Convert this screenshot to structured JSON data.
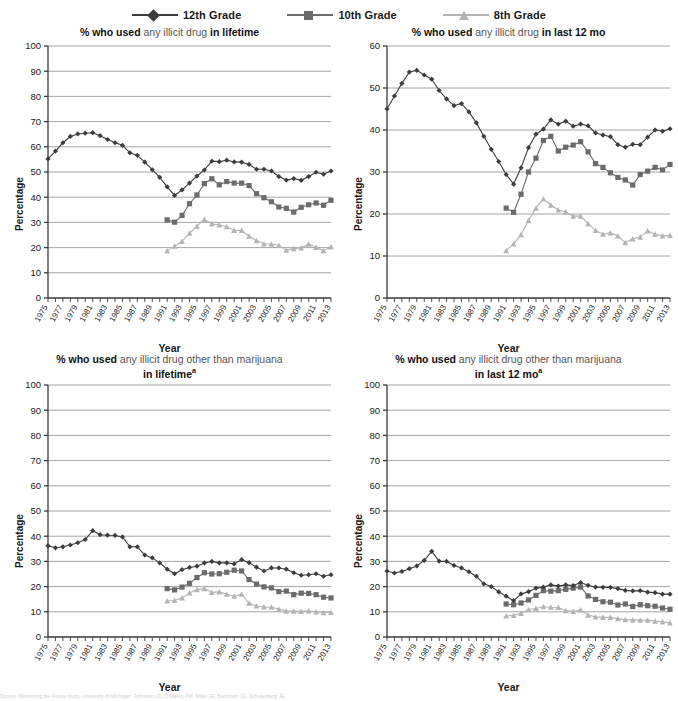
{
  "legend": {
    "items": [
      {
        "label": "12th Grade",
        "marker": "diamond",
        "color": "#3d3d3d"
      },
      {
        "label": "10th Grade",
        "marker": "square",
        "color": "#6b6b6b"
      },
      {
        "label": "8th Grade",
        "marker": "triangle",
        "color": "#b4b4b4"
      }
    ]
  },
  "axis": {
    "xlabel": "Year",
    "ylabel": "Percentage",
    "x_ticks": [
      1975,
      1977,
      1979,
      1981,
      1983,
      1985,
      1987,
      1989,
      1991,
      1993,
      1995,
      1997,
      1999,
      2001,
      2003,
      2005,
      2007,
      2009,
      2011,
      2013
    ],
    "xlim": [
      1975,
      2013
    ]
  },
  "footnote": "Source: Monitoring the Future study, University of Michigan. Johnston LD, O'Malley PM, Miller JE, Bachman JG, Schulenberg JE.",
  "chart_data": [
    {
      "id": "illicit-lifetime",
      "type": "line",
      "title_parts": [
        "% who used",
        " any illicit drug ",
        "in lifetime"
      ],
      "title_sup": "",
      "xlabel": "Year",
      "ylabel": "Percentage",
      "ylim": [
        0,
        100
      ],
      "ytick_step": 10,
      "grid": true,
      "legend_position": "top",
      "series": [
        {
          "name": "12th Grade",
          "marker": "diamond",
          "color": "#3d3d3d",
          "x": [
            1975,
            1976,
            1977,
            1978,
            1979,
            1980,
            1981,
            1982,
            1983,
            1984,
            1985,
            1986,
            1987,
            1988,
            1989,
            1990,
            1991,
            1992,
            1993,
            1994,
            1995,
            1996,
            1997,
            1998,
            1999,
            2000,
            2001,
            2002,
            2003,
            2004,
            2005,
            2006,
            2007,
            2008,
            2009,
            2010,
            2011,
            2012,
            2013
          ],
          "values": [
            55.2,
            58.3,
            61.6,
            64.1,
            65.1,
            65.4,
            65.6,
            64.4,
            62.9,
            61.6,
            60.6,
            57.6,
            56.6,
            53.9,
            50.9,
            47.9,
            44.1,
            40.7,
            42.9,
            45.6,
            48.4,
            50.8,
            54.3,
            54.1,
            54.7,
            54.0,
            53.9,
            53.0,
            51.1,
            51.1,
            50.4,
            48.2,
            46.8,
            47.4,
            46.7,
            48.2,
            49.9,
            49.1,
            50.4
          ]
        },
        {
          "name": "10th Grade",
          "marker": "square",
          "color": "#6b6b6b",
          "x": [
            1991,
            1992,
            1993,
            1994,
            1995,
            1996,
            1997,
            1998,
            1999,
            2000,
            2001,
            2002,
            2003,
            2004,
            2005,
            2006,
            2007,
            2008,
            2009,
            2010,
            2011,
            2012,
            2013
          ],
          "values": [
            31.0,
            30.1,
            32.8,
            37.4,
            40.9,
            45.4,
            47.3,
            44.9,
            46.2,
            45.6,
            45.6,
            44.6,
            41.4,
            39.8,
            38.2,
            36.1,
            35.6,
            34.1,
            36.0,
            37.0,
            37.7,
            36.8,
            38.8
          ]
        },
        {
          "name": "8th Grade",
          "marker": "triangle",
          "color": "#b4b4b4",
          "x": [
            1991,
            1992,
            1993,
            1994,
            1995,
            1996,
            1997,
            1998,
            1999,
            2000,
            2001,
            2002,
            2003,
            2004,
            2005,
            2006,
            2007,
            2008,
            2009,
            2010,
            2011,
            2012,
            2013
          ],
          "values": [
            18.7,
            20.6,
            22.5,
            25.7,
            28.5,
            31.2,
            29.4,
            29.0,
            28.3,
            26.8,
            26.8,
            24.5,
            22.8,
            21.5,
            21.4,
            20.9,
            19.0,
            19.6,
            19.9,
            21.4,
            20.1,
            18.8,
            20.3
          ]
        }
      ]
    },
    {
      "id": "illicit-12mo",
      "type": "line",
      "title_parts": [
        "% who used",
        " any illicit drug ",
        "in last 12 mo"
      ],
      "title_sup": "",
      "xlabel": "Year",
      "ylabel": "Percentage",
      "ylim": [
        0,
        60
      ],
      "ytick_step": 10,
      "grid": true,
      "legend_position": "top",
      "series": [
        {
          "name": "12th Grade",
          "marker": "diamond",
          "color": "#3d3d3d",
          "x": [
            1975,
            1976,
            1977,
            1978,
            1979,
            1980,
            1981,
            1982,
            1983,
            1984,
            1985,
            1986,
            1987,
            1988,
            1989,
            1990,
            1991,
            1992,
            1993,
            1994,
            1995,
            1996,
            1997,
            1998,
            1999,
            2000,
            2001,
            2002,
            2003,
            2004,
            2005,
            2006,
            2007,
            2008,
            2009,
            2010,
            2011,
            2012,
            2013
          ],
          "values": [
            45.0,
            48.1,
            51.1,
            53.8,
            54.2,
            53.1,
            52.1,
            49.4,
            47.4,
            45.8,
            46.3,
            44.3,
            41.7,
            38.5,
            35.4,
            32.5,
            29.4,
            27.1,
            31.0,
            35.8,
            39.0,
            40.2,
            42.4,
            41.4,
            42.1,
            40.9,
            41.4,
            41.0,
            39.3,
            38.8,
            38.4,
            36.5,
            35.9,
            36.6,
            36.5,
            38.3,
            40.0,
            39.7,
            40.3
          ]
        },
        {
          "name": "10th Grade",
          "marker": "square",
          "color": "#6b6b6b",
          "x": [
            1991,
            1992,
            1993,
            1994,
            1995,
            1996,
            1997,
            1998,
            1999,
            2000,
            2001,
            2002,
            2003,
            2004,
            2005,
            2006,
            2007,
            2008,
            2009,
            2010,
            2011,
            2012,
            2013
          ],
          "values": [
            21.4,
            20.4,
            24.7,
            30.0,
            33.3,
            37.5,
            38.5,
            35.0,
            35.9,
            36.4,
            37.2,
            34.8,
            32.0,
            31.1,
            29.8,
            28.7,
            28.1,
            26.9,
            29.4,
            30.2,
            31.1,
            30.5,
            31.8
          ]
        },
        {
          "name": "8th Grade",
          "marker": "triangle",
          "color": "#b4b4b4",
          "x": [
            1991,
            1992,
            1993,
            1994,
            1995,
            1996,
            1997,
            1998,
            1999,
            2000,
            2001,
            2002,
            2003,
            2004,
            2005,
            2006,
            2007,
            2008,
            2009,
            2010,
            2011,
            2012,
            2013
          ],
          "values": [
            11.3,
            12.9,
            15.1,
            18.5,
            21.4,
            23.6,
            22.1,
            21.0,
            20.5,
            19.5,
            19.5,
            17.7,
            16.1,
            15.2,
            15.5,
            14.8,
            13.2,
            14.1,
            14.5,
            16.0,
            15.2,
            14.8,
            14.9
          ]
        }
      ]
    },
    {
      "id": "other-than-mj-lifetime",
      "type": "line",
      "title_parts": [
        "% who used",
        " any illicit drug other than marijuana",
        ""
      ],
      "title_line2": "in lifetime",
      "title_sup": "a",
      "xlabel": "Year",
      "ylabel": "Percentage",
      "ylim": [
        0,
        100
      ],
      "ytick_step": 10,
      "grid": true,
      "legend_position": "top",
      "series": [
        {
          "name": "12th Grade",
          "marker": "diamond",
          "color": "#3d3d3d",
          "x": [
            1975,
            1976,
            1977,
            1978,
            1979,
            1980,
            1981,
            1982,
            1983,
            1984,
            1985,
            1986,
            1987,
            1988,
            1989,
            1990,
            1991,
            1992,
            1993,
            1994,
            1995,
            1996,
            1997,
            1998,
            1999,
            2000,
            2001,
            2002,
            2003,
            2004,
            2005,
            2006,
            2007,
            2008,
            2009,
            2010,
            2011,
            2012,
            2013
          ],
          "values": [
            36.2,
            35.4,
            35.8,
            36.5,
            37.4,
            38.7,
            42.2,
            40.6,
            40.4,
            40.3,
            39.7,
            35.8,
            35.8,
            32.5,
            31.4,
            29.4,
            26.9,
            25.1,
            26.7,
            27.6,
            28.1,
            29.4,
            30.0,
            29.4,
            29.4,
            29.0,
            30.7,
            29.5,
            27.7,
            26.2,
            27.4,
            27.4,
            26.9,
            25.5,
            24.5,
            24.7,
            25.1,
            24.1,
            24.7
          ]
        },
        {
          "name": "10th Grade",
          "marker": "square",
          "color": "#6b6b6b",
          "x": [
            1991,
            1992,
            1993,
            1994,
            1995,
            1996,
            1997,
            1998,
            1999,
            2000,
            2001,
            2002,
            2003,
            2004,
            2005,
            2006,
            2007,
            2008,
            2009,
            2010,
            2011,
            2012,
            2013
          ],
          "values": [
            19.2,
            18.7,
            19.8,
            21.3,
            23.6,
            25.5,
            25.0,
            25.1,
            25.7,
            26.5,
            26.2,
            22.8,
            21.0,
            19.9,
            19.5,
            18.0,
            18.2,
            16.8,
            17.4,
            17.3,
            16.8,
            15.8,
            15.5
          ]
        },
        {
          "name": "8th Grade",
          "marker": "triangle",
          "color": "#b4b4b4",
          "x": [
            1991,
            1992,
            1993,
            1994,
            1995,
            1996,
            1997,
            1998,
            1999,
            2000,
            2001,
            2002,
            2003,
            2004,
            2005,
            2006,
            2007,
            2008,
            2009,
            2010,
            2011,
            2012,
            2013
          ],
          "values": [
            14.3,
            14.5,
            15.5,
            17.5,
            18.8,
            19.2,
            17.7,
            17.9,
            17.0,
            16.2,
            17.0,
            13.4,
            12.3,
            11.9,
            11.8,
            11.1,
            10.3,
            10.3,
            10.2,
            10.4,
            10.0,
            9.7,
            9.8
          ]
        }
      ]
    },
    {
      "id": "other-than-mj-12mo",
      "type": "line",
      "title_parts": [
        "% who used",
        " any illicit drug other than marijuana",
        ""
      ],
      "title_line2": "in last 12 mo",
      "title_sup": "a",
      "xlabel": "Year",
      "ylabel": "Percentage",
      "ylim": [
        0,
        100
      ],
      "ytick_step": 10,
      "grid": true,
      "legend_position": "top",
      "series": [
        {
          "name": "12th Grade",
          "marker": "diamond",
          "color": "#3d3d3d",
          "x": [
            1975,
            1976,
            1977,
            1978,
            1979,
            1980,
            1981,
            1982,
            1983,
            1984,
            1985,
            1986,
            1987,
            1988,
            1989,
            1990,
            1991,
            1992,
            1993,
            1994,
            1995,
            1996,
            1997,
            1998,
            1999,
            2000,
            2001,
            2002,
            2003,
            2004,
            2005,
            2006,
            2007,
            2008,
            2009,
            2010,
            2011,
            2012,
            2013
          ],
          "values": [
            26.2,
            25.4,
            26.0,
            27.1,
            28.2,
            30.4,
            34.0,
            30.1,
            30.0,
            28.4,
            27.4,
            25.9,
            24.1,
            21.1,
            20.0,
            17.9,
            16.2,
            14.4,
            17.1,
            18.0,
            19.4,
            19.8,
            20.7,
            20.2,
            20.7,
            20.4,
            21.6,
            20.5,
            19.8,
            19.7,
            19.7,
            19.2,
            18.5,
            18.3,
            18.4,
            17.8,
            17.6,
            17.0,
            17.0
          ]
        },
        {
          "name": "10th Grade",
          "marker": "square",
          "color": "#6b6b6b",
          "x": [
            1991,
            1992,
            1993,
            1994,
            1995,
            1996,
            1997,
            1998,
            1999,
            2000,
            2001,
            2002,
            2003,
            2004,
            2005,
            2006,
            2007,
            2008,
            2009,
            2010,
            2011,
            2012,
            2013
          ],
          "values": [
            13.1,
            12.8,
            13.5,
            14.7,
            16.5,
            18.4,
            18.2,
            18.4,
            18.9,
            19.4,
            19.8,
            16.3,
            14.9,
            14.0,
            13.8,
            12.7,
            13.1,
            12.1,
            12.8,
            12.4,
            12.2,
            11.5,
            11.0
          ]
        },
        {
          "name": "8th Grade",
          "marker": "triangle",
          "color": "#b4b4b4",
          "x": [
            1991,
            1992,
            1993,
            1994,
            1995,
            1996,
            1997,
            1998,
            1999,
            2000,
            2001,
            2002,
            2003,
            2004,
            2005,
            2006,
            2007,
            2008,
            2009,
            2010,
            2011,
            2012,
            2013
          ],
          "values": [
            8.4,
            8.6,
            9.4,
            10.9,
            11.3,
            12.0,
            11.8,
            11.7,
            10.5,
            10.2,
            10.8,
            8.7,
            8.0,
            7.8,
            7.8,
            7.3,
            6.9,
            6.8,
            6.7,
            6.7,
            6.3,
            6.0,
            5.6
          ]
        }
      ]
    }
  ]
}
